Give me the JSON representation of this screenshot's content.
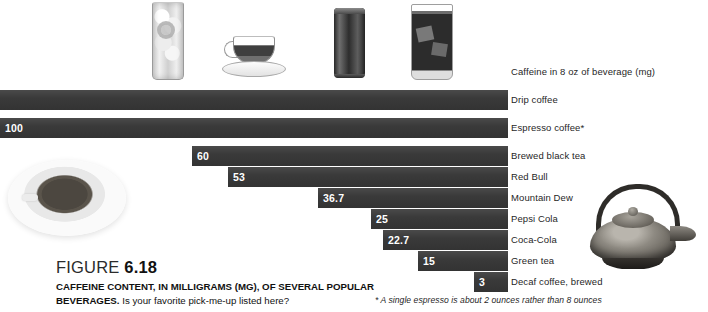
{
  "figure": {
    "number_prefix": "FIGURE ",
    "number": "6.18",
    "title_bold": "CAFFEINE CONTENT, IN MILLIGRAMS (MG), OF SEVERAL POPULAR BEVERAGES.",
    "title_rest": " Is your favorite pick-me-up listed here?",
    "footnote": "* A single espresso is about 2 ounces rather than 8 ounces"
  },
  "legend": {
    "title": "Caffeine in 8 oz of beverage (mg)"
  },
  "photos": [
    {
      "name": "iced-lemon-drink-photo"
    },
    {
      "name": "glass-teacup-photo"
    },
    {
      "name": "energy-drink-can-photo"
    },
    {
      "name": "iced-cola-glass-photo"
    },
    {
      "name": "coffee-cup-topdown-photo"
    },
    {
      "name": "cast-iron-teapot-photo"
    }
  ],
  "chart_data": {
    "type": "bar",
    "orientation": "horizontal-right-aligned",
    "title": "CAFFEINE CONTENT, IN MILLIGRAMS (MG), OF SEVERAL POPULAR BEVERAGES.",
    "xlabel": "Caffeine in 8 oz of beverage (mg)",
    "ylabel": "",
    "grid": false,
    "legend_position": "right",
    "bar_color": "#3a3a3a",
    "value_label_color": "#ffffff",
    "categories": [
      "Drip coffee",
      "Espresso coffee*",
      "Brewed black tea",
      "Red Bull",
      "Mountain Dew",
      "Pepsi Cola",
      "Coca-Cola",
      "Green tea",
      "Decaf coffee, brewed"
    ],
    "values": [
      145,
      100,
      60,
      53,
      36.7,
      25,
      22.7,
      15,
      3
    ],
    "value_labels": [
      "",
      "100",
      "60",
      "53",
      "36.7",
      "25",
      "22.7",
      "15",
      "3"
    ],
    "note": "Drip coffee bar runs off the left edge of the crop so its value label is not visible."
  },
  "rows": [
    {
      "label": "Drip coffee",
      "value_label": "",
      "left": -30,
      "top": 90
    },
    {
      "label": "Espresso coffee*",
      "value_label": "100",
      "left": 0,
      "top": 118
    },
    {
      "label": "Brewed black tea",
      "value_label": "60",
      "left": 192,
      "top": 146
    },
    {
      "label": "Red Bull",
      "value_label": "53",
      "left": 228,
      "top": 167
    },
    {
      "label": "Mountain Dew",
      "value_label": "36.7",
      "left": 318,
      "top": 188
    },
    {
      "label": "Pepsi Cola",
      "value_label": "25",
      "left": 371,
      "top": 209
    },
    {
      "label": "Coca-Cola",
      "value_label": "22.7",
      "left": 383,
      "top": 230
    },
    {
      "label": "Green tea",
      "value_label": "15",
      "left": 418,
      "top": 251
    },
    {
      "label": "Decaf coffee, brewed",
      "value_label": "3",
      "left": 474,
      "top": 272
    }
  ]
}
